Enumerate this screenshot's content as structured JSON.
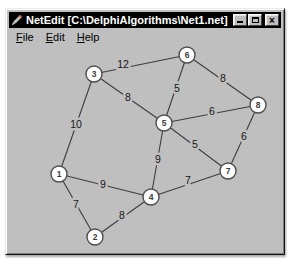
{
  "window": {
    "title": "NetEdit [C:\\DelphiAlgorithms\\Net1.net]",
    "controls": {
      "minimize_icon": "minimize-icon",
      "maximize_icon": "maximize-icon",
      "close_glyph": "×"
    }
  },
  "menu": {
    "items": [
      {
        "label": "File",
        "first": "F",
        "rest": "ile"
      },
      {
        "label": "Edit",
        "first": "E",
        "rest": "dit"
      },
      {
        "label": "Help",
        "first": "H",
        "rest": "elp"
      }
    ]
  },
  "colors": {
    "titlebar": "#000000",
    "window_face": "#bfbfbf",
    "node_fill": "#ffffff",
    "node_stroke": "#4f4f4f",
    "edge": "#3d3d3d",
    "label": "#161616"
  },
  "chart_data": {
    "type": "graph",
    "nodes": [
      {
        "id": "1",
        "x": 59,
        "y": 174
      },
      {
        "id": "2",
        "x": 95,
        "y": 237
      },
      {
        "id": "3",
        "x": 94,
        "y": 74
      },
      {
        "id": "4",
        "x": 151,
        "y": 197
      },
      {
        "id": "5",
        "x": 164,
        "y": 123
      },
      {
        "id": "6",
        "x": 187,
        "y": 55
      },
      {
        "id": "7",
        "x": 228,
        "y": 171
      },
      {
        "id": "8",
        "x": 258,
        "y": 105
      }
    ],
    "node_radius": 8,
    "edges": [
      {
        "from": "3",
        "to": "6",
        "weight": 12,
        "label_x": 123,
        "label_y": 68
      },
      {
        "from": "3",
        "to": "5",
        "weight": 8,
        "label_x": 128,
        "label_y": 101
      },
      {
        "from": "1",
        "to": "3",
        "weight": 10,
        "label_x": 76,
        "label_y": 128
      },
      {
        "from": "6",
        "to": "5",
        "weight": 5,
        "label_x": 177,
        "label_y": 92
      },
      {
        "from": "6",
        "to": "8",
        "weight": 8,
        "label_x": 223,
        "label_y": 82
      },
      {
        "from": "5",
        "to": "8",
        "weight": 6,
        "label_x": 212,
        "label_y": 115
      },
      {
        "from": "5",
        "to": "7",
        "weight": 5,
        "label_x": 195,
        "label_y": 148
      },
      {
        "from": "5",
        "to": "4",
        "weight": 9,
        "label_x": 158,
        "label_y": 163
      },
      {
        "from": "7",
        "to": "8",
        "weight": 6,
        "label_x": 244,
        "label_y": 140
      },
      {
        "from": "4",
        "to": "7",
        "weight": 7,
        "label_x": 188,
        "label_y": 184
      },
      {
        "from": "1",
        "to": "4",
        "weight": 9,
        "label_x": 103,
        "label_y": 188
      },
      {
        "from": "1",
        "to": "2",
        "weight": 7,
        "label_x": 76,
        "label_y": 208
      },
      {
        "from": "2",
        "to": "4",
        "weight": 8,
        "label_x": 122,
        "label_y": 219
      }
    ]
  }
}
